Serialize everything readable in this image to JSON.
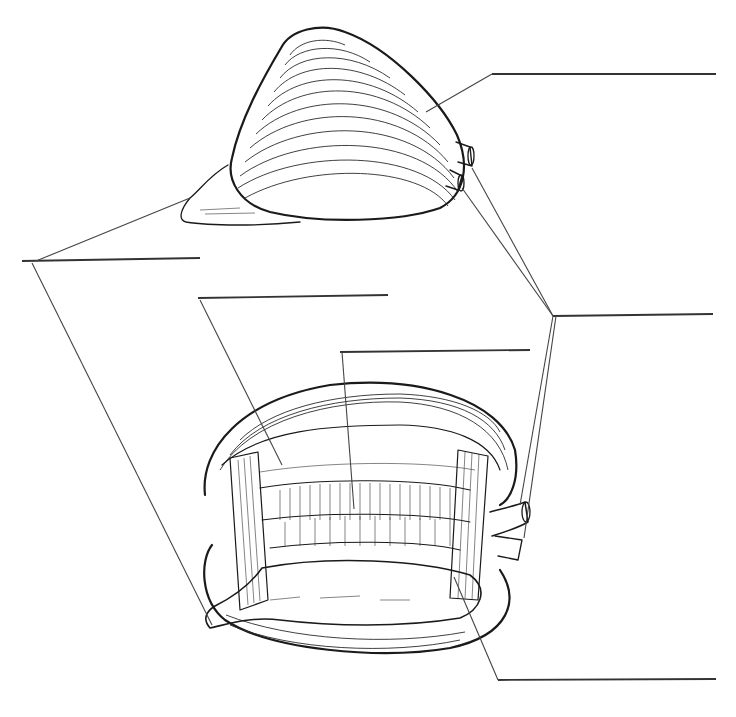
{
  "diagram": {
    "views": [
      {
        "id": "closed-clam",
        "description": "Closed clam with foot and siphons extended"
      },
      {
        "id": "open-clam",
        "description": "Open clam showing internal organs"
      }
    ],
    "labels": [
      {
        "id": "label-shell",
        "text": "",
        "line": [
          492,
          74,
          716,
          74
        ]
      },
      {
        "id": "label-foot",
        "text": "",
        "line": [
          22,
          261,
          200,
          258
        ]
      },
      {
        "id": "label-mantle",
        "text": "",
        "line": [
          198,
          298,
          388,
          295
        ]
      },
      {
        "id": "label-gills",
        "text": "",
        "line": [
          340,
          352,
          530,
          350
        ]
      },
      {
        "id": "label-siphons",
        "text": "",
        "line": [
          553,
          316,
          713,
          314
        ]
      },
      {
        "id": "label-adductor-muscle",
        "text": "",
        "line": [
          498,
          680,
          716,
          679
        ]
      }
    ],
    "colors": {
      "ink": "#1a1a1a",
      "background": "#ffffff"
    }
  }
}
